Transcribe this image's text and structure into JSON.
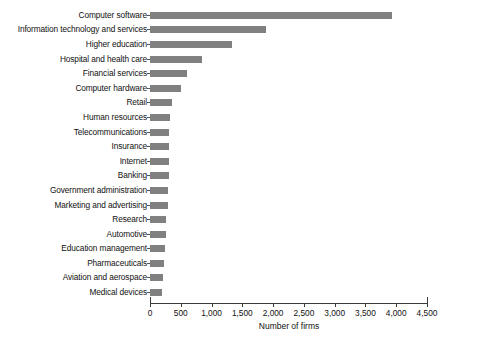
{
  "chart_data": {
    "type": "bar",
    "orientation": "horizontal",
    "title": "",
    "xlabel": "Number of firms",
    "ylabel": "",
    "xlim": [
      0,
      4500
    ],
    "xticks": [
      "0",
      "500",
      "1,000",
      "1,500",
      "2,000",
      "2,500",
      "3,000",
      "3,500",
      "4,000",
      "4,500"
    ],
    "xtick_values": [
      0,
      500,
      1000,
      1500,
      2000,
      2500,
      3000,
      3500,
      4000,
      4500
    ],
    "grid": false,
    "legend": null,
    "bar_color": "#808080",
    "categories": [
      "Computer software",
      "Information technology and services",
      "Higher education",
      "Hospital and health care",
      "Financial services",
      "Computer hardware",
      "Retail",
      "Human resources",
      "Telecommunications",
      "Insurance",
      "Internet",
      "Banking",
      "Government administration",
      "Marketing and advertising",
      "Research",
      "Automotive",
      "Education management",
      "Pharmaceuticals",
      "Aviation and aerospace",
      "Medical devices"
    ],
    "values": [
      3930,
      1880,
      1340,
      850,
      605,
      505,
      360,
      320,
      315,
      310,
      310,
      305,
      300,
      295,
      260,
      255,
      240,
      235,
      215,
      200
    ]
  },
  "caption": ""
}
